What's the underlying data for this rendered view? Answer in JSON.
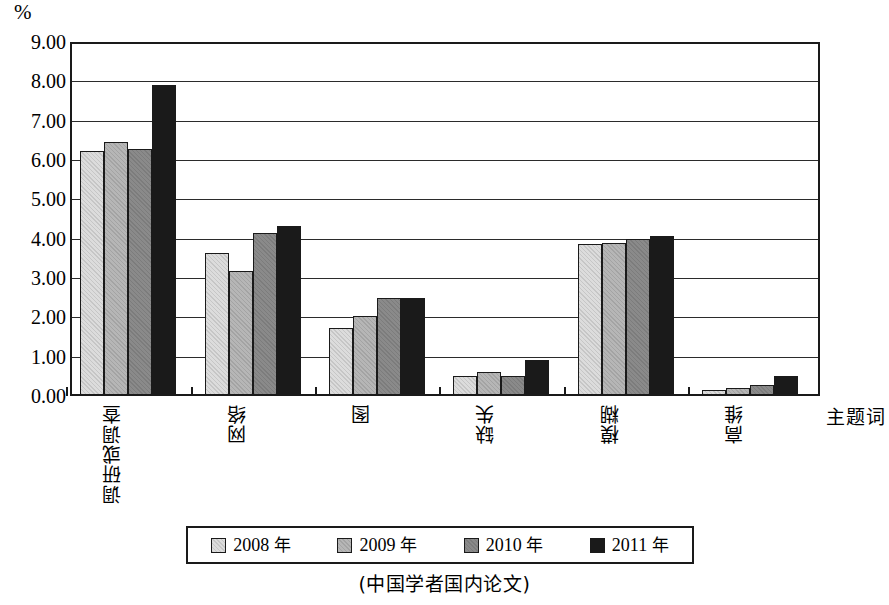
{
  "chart_data": {
    "type": "bar",
    "title": "",
    "subtitle": "",
    "caption": "(中国学者国内论文)",
    "xlabel": "主题词",
    "ylabel": "%",
    "ylim": [
      0,
      9
    ],
    "ytick_labels": [
      "9.00",
      "8.00",
      "7.00",
      "6.00",
      "5.00",
      "4.00",
      "3.00",
      "2.00",
      "1.00",
      "0.00"
    ],
    "ytick_values": [
      9,
      8,
      7,
      6,
      5,
      4,
      3,
      2,
      1,
      0
    ],
    "grid": true,
    "legend_position": "bottom",
    "categories": [
      "调研或调查",
      "网络",
      "图",
      "缺失",
      "模糊",
      "高维"
    ],
    "series": [
      {
        "name": "2008 年",
        "color": "#dcdcdc",
        "values": [
          6.25,
          3.65,
          1.73,
          0.48,
          3.87,
          0.13
        ]
      },
      {
        "name": "2009 年",
        "color": "#b6b6b6",
        "values": [
          6.48,
          3.17,
          2.02,
          0.58,
          3.9,
          0.18
        ]
      },
      {
        "name": "2010 年",
        "color": "#8a8a8a",
        "values": [
          6.3,
          4.15,
          2.5,
          0.48,
          4.0,
          0.25
        ]
      },
      {
        "name": "2011 年",
        "color": "#1a1a1a",
        "values": [
          7.95,
          4.33,
          2.5,
          0.9,
          4.08,
          0.48
        ]
      }
    ]
  },
  "legend": {
    "items": [
      {
        "label": "2008 年"
      },
      {
        "label": "2009 年"
      },
      {
        "label": "2010 年"
      },
      {
        "label": "2011 年"
      }
    ]
  }
}
